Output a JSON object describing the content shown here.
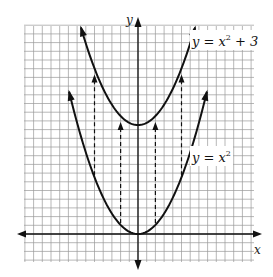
{
  "chart_data": {
    "type": "line",
    "title": "",
    "xlabel": "x",
    "ylabel": "y",
    "grid": true,
    "series": [
      {
        "name": "y = x^2 + 3",
        "label_main": "y = x",
        "label_exp": "2",
        "label_tail": " + 3",
        "vertex": [
          0,
          3
        ],
        "x": [
          -1.6,
          -1.2,
          -0.8,
          -0.4,
          0,
          0.4,
          0.8,
          1.2,
          1.6
        ],
        "values": [
          5.56,
          4.44,
          3.64,
          3.16,
          3.0,
          3.16,
          3.64,
          4.44,
          5.56
        ]
      },
      {
        "name": "y = x^2",
        "label_main": "y = x",
        "label_exp": "2",
        "label_tail": "",
        "vertex": [
          0,
          0
        ],
        "x": [
          -2.0,
          -1.5,
          -1.0,
          -0.5,
          0,
          0.5,
          1.0,
          1.5,
          2.0
        ],
        "values": [
          4.0,
          2.25,
          1.0,
          0.25,
          0,
          0.25,
          1.0,
          2.25,
          4.0
        ]
      }
    ],
    "annotations": {
      "type": "vertical shift arrows (dashed, +3 units)",
      "arrows_x": [
        -1.25,
        -0.5,
        0.5,
        1.25
      ]
    },
    "grid_cells_per_unit": 4,
    "xlim": [
      -3.3,
      3.5
    ],
    "ylim": [
      -0.8,
      6.0
    ]
  }
}
